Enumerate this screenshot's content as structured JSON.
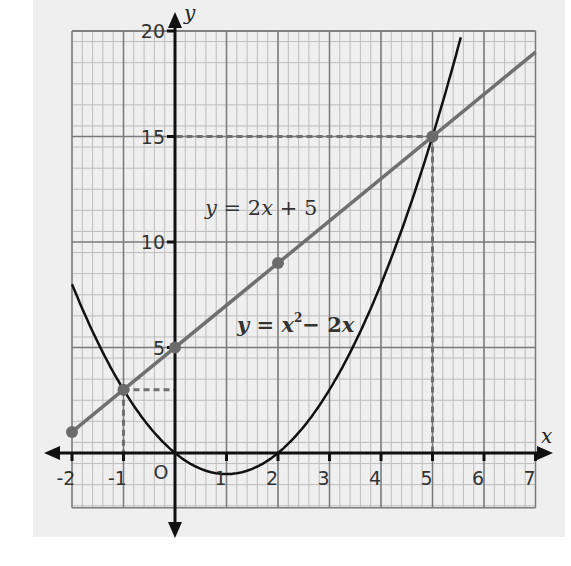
{
  "chart_data": {
    "type": "line",
    "title": "",
    "xlabel": "x",
    "ylabel": "y",
    "xlim": [
      -2,
      7
    ],
    "ylim": [
      -2.6,
      20
    ],
    "grid": true,
    "x_ticks": [
      "-2",
      "-1",
      "O",
      "1",
      "2",
      "3",
      "4",
      "5",
      "6",
      "7"
    ],
    "y_ticks": [
      "5",
      "10",
      "15",
      "20"
    ],
    "series": [
      {
        "name": "y = 2x + 5",
        "label_parts": {
          "lhs": "y",
          "eq": " = 2",
          "var": "x",
          "rest": " + 5"
        },
        "color": "#707070",
        "x": [
          -2,
          7
        ],
        "y": [
          1,
          19
        ],
        "marked_points": [
          [
            -2,
            1
          ],
          [
            -1,
            3
          ],
          [
            0,
            5
          ],
          [
            2,
            9
          ],
          [
            5,
            15
          ]
        ]
      },
      {
        "name": "y = x² − 2x",
        "label_parts": {
          "lhs": "y",
          "eq": " = ",
          "var": "x",
          "sup": "2",
          "rest": "− 2",
          "var2": "x"
        },
        "color": "#111111",
        "x": [
          -2,
          -1,
          0,
          1,
          2,
          3,
          4,
          5,
          5.58
        ],
        "y": [
          8,
          3,
          0,
          -1,
          0,
          3,
          8,
          15,
          20
        ]
      }
    ],
    "annotations": [
      {
        "type": "dashed-guide",
        "point": [
          -1,
          3
        ]
      },
      {
        "type": "dashed-guide",
        "point": [
          5,
          15
        ]
      }
    ]
  }
}
